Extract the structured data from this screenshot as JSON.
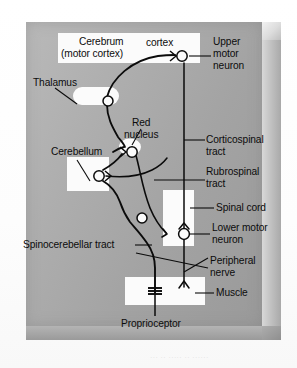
{
  "figure": {
    "type": "anatomical-schematic",
    "panel": {
      "background_color": "#a9a9a9",
      "bevel_highlight": "#dcdcdc",
      "bevel_shadow": "#8f8f8f",
      "structure_fill": "#fbfbfb",
      "pathway_color": "#0b0b0b",
      "label_color": "#0c0c0c"
    },
    "faint_scan_text": "․․․  ․․ ․․․․․  ․․  ․․․․․․",
    "structures": [
      {
        "name": "cerebrum",
        "label": "Cerebrum",
        "label2": "(motor cortex)"
      },
      {
        "name": "cortex",
        "label": "cortex"
      },
      {
        "name": "thalamus",
        "label": "Thalamus"
      },
      {
        "name": "red-nucleus",
        "label": "Red",
        "label2": "nucleus"
      },
      {
        "name": "cerebellum",
        "label": "Cerebellum"
      },
      {
        "name": "spinal-cord",
        "label": "Spinal cord"
      },
      {
        "name": "muscle",
        "label": "Muscle"
      }
    ],
    "labels": {
      "cerebrum_line1": "Cerebrum",
      "cerebrum_line2": "(motor cortex)",
      "cortex": "cortex",
      "upper_motor_neuron_l1": "Upper",
      "upper_motor_neuron_l2": "motor",
      "upper_motor_neuron_l3": "neuron",
      "thalamus": "Thalamus",
      "red_nucleus_l1": "Red",
      "red_nucleus_l2": "nucleus",
      "cerebellum": "Cerebellum",
      "corticospinal_l1": "Corticospinal",
      "corticospinal_l2": "tract",
      "rubrospinal_l1": "Rubrospinal",
      "rubrospinal_l2": "tract",
      "spinal_cord": "Spinal cord",
      "lower_motor_neuron_l1": "Lower motor",
      "lower_motor_neuron_l2": "neuron",
      "peripheral_nerve_l1": "Peripheral",
      "peripheral_nerve_l2": "nerve",
      "spinocerebellar": "Spinocerebellar tract",
      "muscle": "Muscle",
      "proprioceptor": "Proprioceptor"
    },
    "tracts": [
      "Corticospinal tract",
      "Rubrospinal tract",
      "Spinocerebellar tract",
      "Peripheral nerve"
    ],
    "neurons": [
      "Upper motor neuron",
      "Lower motor neuron"
    ],
    "endpoints": [
      "Muscle",
      "Proprioceptor"
    ]
  }
}
